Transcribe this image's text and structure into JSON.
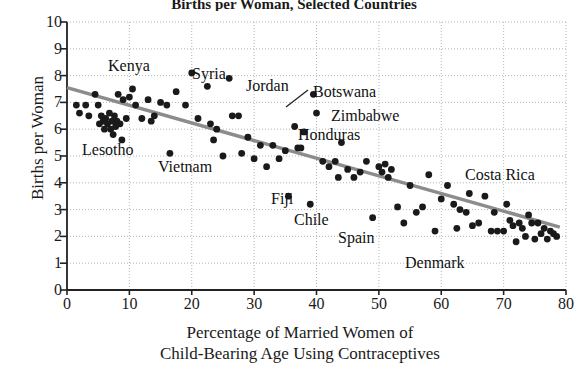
{
  "chart_data": {
    "type": "scatter",
    "title": "Births per Woman, Selected Countries",
    "xlabel_line1": "Percentage of Married Women of",
    "xlabel_line2": "Child-Bearing Age Using Contraceptives",
    "ylabel": "Births per Woman",
    "xlim": [
      0,
      80
    ],
    "ylim": [
      0,
      10
    ],
    "xticks": [
      0,
      10,
      20,
      30,
      40,
      50,
      60,
      70,
      80
    ],
    "yticks": [
      0,
      1,
      2,
      3,
      4,
      5,
      6,
      7,
      8,
      9,
      10
    ],
    "grid": true,
    "grid_style": "dotted",
    "legend": "none",
    "point_color": "#1a1a1a",
    "trendline": {
      "label": "least-squares regression line",
      "color": "#8c8c8c",
      "x_start": 0,
      "y_start": 7.55,
      "x_end": 79,
      "y_end": 2.35
    },
    "points": [
      {
        "x": 1.5,
        "y": 6.9
      },
      {
        "x": 2.0,
        "y": 6.6
      },
      {
        "x": 3.0,
        "y": 6.9
      },
      {
        "x": 3.5,
        "y": 6.5
      },
      {
        "x": 4.5,
        "y": 7.3
      },
      {
        "x": 5.0,
        "y": 6.9
      },
      {
        "x": 5.2,
        "y": 6.2
      },
      {
        "x": 5.5,
        "y": 6.5
      },
      {
        "x": 5.8,
        "y": 6.3
      },
      {
        "x": 6.0,
        "y": 6.0
      },
      {
        "x": 6.2,
        "y": 6.4
      },
      {
        "x": 6.5,
        "y": 6.2
      },
      {
        "x": 6.8,
        "y": 6.6
      },
      {
        "x": 7.0,
        "y": 6.0
      },
      {
        "x": 7.2,
        "y": 6.3
      },
      {
        "x": 7.4,
        "y": 5.8
      },
      {
        "x": 7.6,
        "y": 6.5
      },
      {
        "x": 7.8,
        "y": 6.1
      },
      {
        "x": 8.0,
        "y": 6.3
      },
      {
        "x": 8.2,
        "y": 7.3
      },
      {
        "x": 8.5,
        "y": 6.2
      },
      {
        "x": 8.8,
        "y": 5.6
      },
      {
        "x": 9.0,
        "y": 7.1
      },
      {
        "x": 9.5,
        "y": 6.4
      },
      {
        "x": 10.0,
        "y": 7.2
      },
      {
        "x": 10.5,
        "y": 7.5
      },
      {
        "x": 11.0,
        "y": 6.9
      },
      {
        "x": 12.0,
        "y": 6.4
      },
      {
        "x": 13.0,
        "y": 7.1
      },
      {
        "x": 13.5,
        "y": 6.3
      },
      {
        "x": 14.0,
        "y": 6.5
      },
      {
        "x": 15.0,
        "y": 7.0
      },
      {
        "x": 16.0,
        "y": 6.9
      },
      {
        "x": 16.5,
        "y": 5.1
      },
      {
        "x": 17.5,
        "y": 7.4
      },
      {
        "x": 19.0,
        "y": 6.9
      },
      {
        "x": 20.0,
        "y": 8.1
      },
      {
        "x": 21.0,
        "y": 6.4
      },
      {
        "x": 22.5,
        "y": 7.6
      },
      {
        "x": 23.0,
        "y": 6.2
      },
      {
        "x": 23.5,
        "y": 5.6
      },
      {
        "x": 24.0,
        "y": 6.0
      },
      {
        "x": 25.0,
        "y": 5.0
      },
      {
        "x": 26.0,
        "y": 7.9
      },
      {
        "x": 26.5,
        "y": 6.5
      },
      {
        "x": 27.5,
        "y": 6.5
      },
      {
        "x": 28.0,
        "y": 5.1
      },
      {
        "x": 29.0,
        "y": 5.7
      },
      {
        "x": 30.0,
        "y": 4.9
      },
      {
        "x": 31.0,
        "y": 5.4
      },
      {
        "x": 32.0,
        "y": 4.6
      },
      {
        "x": 33.0,
        "y": 5.4
      },
      {
        "x": 34.0,
        "y": 4.9
      },
      {
        "x": 35.0,
        "y": 5.2
      },
      {
        "x": 35.5,
        "y": 3.5
      },
      {
        "x": 36.5,
        "y": 6.1
      },
      {
        "x": 37.0,
        "y": 5.3
      },
      {
        "x": 37.5,
        "y": 5.3
      },
      {
        "x": 38.0,
        "y": 5.9
      },
      {
        "x": 39.0,
        "y": 3.2
      },
      {
        "x": 39.5,
        "y": 7.3
      },
      {
        "x": 40.0,
        "y": 6.6
      },
      {
        "x": 41.0,
        "y": 4.8
      },
      {
        "x": 42.0,
        "y": 4.6
      },
      {
        "x": 43.0,
        "y": 4.8
      },
      {
        "x": 43.5,
        "y": 4.2
      },
      {
        "x": 44.0,
        "y": 5.5
      },
      {
        "x": 45.0,
        "y": 4.5
      },
      {
        "x": 46.0,
        "y": 4.2
      },
      {
        "x": 47.0,
        "y": 4.4
      },
      {
        "x": 48.0,
        "y": 4.8
      },
      {
        "x": 49.0,
        "y": 2.7
      },
      {
        "x": 50.0,
        "y": 4.6
      },
      {
        "x": 50.5,
        "y": 4.4
      },
      {
        "x": 51.0,
        "y": 4.7
      },
      {
        "x": 51.5,
        "y": 4.2
      },
      {
        "x": 52.0,
        "y": 4.5
      },
      {
        "x": 53.0,
        "y": 3.1
      },
      {
        "x": 54.0,
        "y": 2.5
      },
      {
        "x": 55.0,
        "y": 3.9
      },
      {
        "x": 56.0,
        "y": 2.9
      },
      {
        "x": 57.0,
        "y": 3.1
      },
      {
        "x": 58.0,
        "y": 4.3
      },
      {
        "x": 59.0,
        "y": 2.2
      },
      {
        "x": 60.0,
        "y": 3.4
      },
      {
        "x": 61.0,
        "y": 3.9
      },
      {
        "x": 62.0,
        "y": 3.2
      },
      {
        "x": 62.5,
        "y": 2.3
      },
      {
        "x": 63.0,
        "y": 3.0
      },
      {
        "x": 64.0,
        "y": 2.9
      },
      {
        "x": 64.5,
        "y": 3.6
      },
      {
        "x": 65.0,
        "y": 2.4
      },
      {
        "x": 66.0,
        "y": 2.5
      },
      {
        "x": 67.0,
        "y": 3.5
      },
      {
        "x": 68.0,
        "y": 2.2
      },
      {
        "x": 68.5,
        "y": 2.9
      },
      {
        "x": 69.0,
        "y": 2.2
      },
      {
        "x": 70.0,
        "y": 2.2
      },
      {
        "x": 70.5,
        "y": 3.2
      },
      {
        "x": 71.0,
        "y": 2.6
      },
      {
        "x": 71.5,
        "y": 2.4
      },
      {
        "x": 72.0,
        "y": 1.8
      },
      {
        "x": 72.5,
        "y": 2.5
      },
      {
        "x": 73.0,
        "y": 2.3
      },
      {
        "x": 73.5,
        "y": 2.0
      },
      {
        "x": 74.0,
        "y": 2.8
      },
      {
        "x": 74.5,
        "y": 2.5
      },
      {
        "x": 75.0,
        "y": 1.9
      },
      {
        "x": 75.5,
        "y": 2.5
      },
      {
        "x": 76.0,
        "y": 2.1
      },
      {
        "x": 76.5,
        "y": 2.3
      },
      {
        "x": 77.0,
        "y": 1.9
      },
      {
        "x": 77.5,
        "y": 2.2
      },
      {
        "x": 78.0,
        "y": 2.1
      },
      {
        "x": 78.5,
        "y": 2.0
      }
    ],
    "annotations": [
      {
        "text": "Kenya",
        "x": 108,
        "y": 58,
        "leader": null
      },
      {
        "text": "Syria",
        "x": 192,
        "y": 66,
        "leader": null
      },
      {
        "text": "Jordan",
        "x": 246,
        "y": 78,
        "leader": null
      },
      {
        "text": "Botswana",
        "x": 313,
        "y": 84,
        "leader": {
          "x1": 286,
          "y1": 107,
          "x2": 308,
          "y2": 90
        }
      },
      {
        "text": "Zimbabwe",
        "x": 331,
        "y": 108,
        "leader": null
      },
      {
        "text": "Honduras",
        "x": 298,
        "y": 127,
        "leader": null
      },
      {
        "text": "Lesotho",
        "x": 82,
        "y": 142,
        "leader": null
      },
      {
        "text": "Vietnam",
        "x": 158,
        "y": 159,
        "leader": null
      },
      {
        "text": "Costa Rica",
        "x": 465,
        "y": 167,
        "leader": null
      },
      {
        "text": "Fiji",
        "x": 271,
        "y": 191,
        "leader": null
      },
      {
        "text": "Chile",
        "x": 294,
        "y": 212,
        "leader": null
      },
      {
        "text": "Spain",
        "x": 338,
        "y": 230,
        "leader": null
      },
      {
        "text": "Denmark",
        "x": 405,
        "y": 255,
        "leader": null
      }
    ]
  }
}
